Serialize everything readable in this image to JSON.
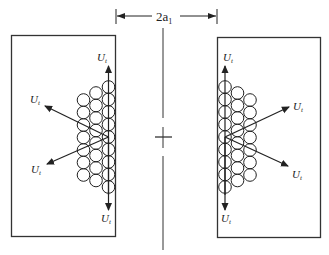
{
  "diagram": {
    "type": "schematic",
    "dimension_label": {
      "main": "2a",
      "sub": "1"
    },
    "vector_label": {
      "main": "U",
      "sub": "t"
    },
    "colors": {
      "stroke": "#222222",
      "background": "#ffffff"
    },
    "left_plate": {
      "x": 11,
      "y": 35,
      "width": 105,
      "height": 202
    },
    "right_plate": {
      "x": 217,
      "y": 37,
      "width": 104,
      "height": 201
    },
    "center_axis": {
      "x": 163,
      "y_top": 20,
      "y_bottom": 250,
      "cross_y": 137
    },
    "left_arrows": [
      {
        "id": "up",
        "from": [
          108,
          137
        ],
        "to": [
          108,
          66
        ],
        "label_pos": [
          97,
          58
        ]
      },
      {
        "id": "upper-left",
        "from": [
          108,
          137
        ],
        "to": [
          45,
          106
        ],
        "label_pos": [
          29,
          107
        ]
      },
      {
        "id": "lower-left",
        "from": [
          108,
          137
        ],
        "to": [
          47,
          164
        ],
        "label_pos": [
          30,
          171
        ]
      },
      {
        "id": "down",
        "from": [
          108,
          137
        ],
        "to": [
          108,
          210
        ],
        "label_pos": [
          101,
          221
        ]
      }
    ],
    "right_arrows": [
      {
        "id": "up",
        "from": [
          225,
          137
        ],
        "to": [
          225,
          66
        ],
        "label_pos": [
          223,
          58
        ]
      },
      {
        "id": "upper-right",
        "from": [
          225,
          137
        ],
        "to": [
          289,
          107
        ],
        "label_pos": [
          291,
          111
        ]
      },
      {
        "id": "lower-right",
        "from": [
          225,
          137
        ],
        "to": [
          288,
          166
        ],
        "label_pos": [
          291,
          178
        ]
      },
      {
        "id": "down",
        "from": [
          225,
          137
        ],
        "to": [
          225,
          210
        ],
        "label_pos": [
          221,
          221
        ]
      }
    ],
    "sphere_radius": 6.3
  }
}
